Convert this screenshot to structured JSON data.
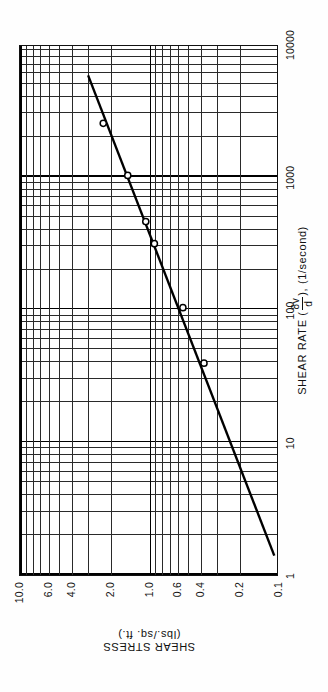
{
  "figure": {
    "kind": "log-log-rheogram",
    "orientation": "rotated-90"
  },
  "axes": {
    "x": {
      "title_prefix": "SHEAR RATE (",
      "fraction_numerator": "8v",
      "fraction_denominator": "d",
      "title_suffix": "),  (1/second)",
      "title_plain": "SHEAR RATE (8v/d),  (1/second)",
      "ticks": [
        "1",
        "10",
        "100",
        "1000",
        "10000"
      ]
    },
    "y": {
      "title_line1": "SHEAR STRESS",
      "title_line2": "(lbs./sq. ft.)",
      "title_plain": "SHEAR STRESS  (lbs./sq. ft.)",
      "ticks": [
        "10.0",
        "6.0",
        "4.0",
        "2.0",
        "1.0",
        "0.6",
        "0.4",
        "0.2",
        "0.1"
      ]
    }
  },
  "chart_data": {
    "type": "scatter",
    "title": "",
    "xlabel": "SHEAR RATE (8v/d), (1/second)",
    "ylabel": "SHEAR STRESS (lbs./sq. ft.)",
    "xscale": "log",
    "yscale": "log",
    "xlim": [
      1,
      10000
    ],
    "ylim": [
      0.1,
      10
    ],
    "grid": true,
    "legend": "none",
    "xticks": [
      1,
      10,
      100,
      1000,
      10000
    ],
    "yticks": [
      0.1,
      0.2,
      0.4,
      0.6,
      1.0,
      2.0,
      4.0,
      6.0,
      10.0
    ],
    "points": [
      {
        "x": 40,
        "y": 0.37
      },
      {
        "x": 105,
        "y": 0.54
      },
      {
        "x": 320,
        "y": 0.9
      },
      {
        "x": 470,
        "y": 1.05
      },
      {
        "x": 1050,
        "y": 1.45
      },
      {
        "x": 2600,
        "y": 2.25
      }
    ],
    "fit_line": {
      "label": "power-law fit",
      "x": [
        1.4,
        6000
      ],
      "y": [
        0.105,
        2.95
      ]
    }
  }
}
